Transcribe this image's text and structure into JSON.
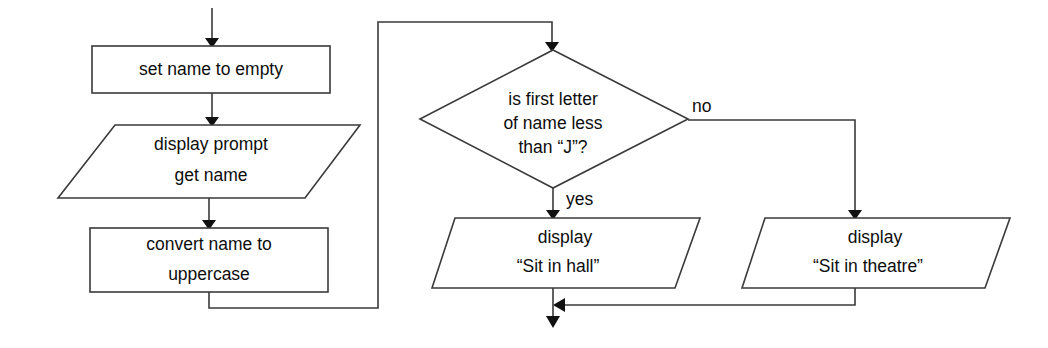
{
  "diagram": {
    "type": "flowchart",
    "nodes": [
      {
        "id": "set-name",
        "shape": "process",
        "lines": [
          "set name to empty"
        ]
      },
      {
        "id": "display-prompt",
        "shape": "input-output",
        "lines": [
          "display prompt",
          "get name"
        ]
      },
      {
        "id": "convert-uppercase",
        "shape": "process",
        "lines": [
          "convert name to",
          "uppercase"
        ]
      },
      {
        "id": "first-letter-decision",
        "shape": "decision",
        "lines": [
          "is first letter",
          "of name less",
          "than “J”?"
        ]
      },
      {
        "id": "display-hall",
        "shape": "input-output",
        "lines": [
          "display",
          "“Sit in hall”"
        ]
      },
      {
        "id": "display-theatre",
        "shape": "input-output",
        "lines": [
          "display",
          "“Sit in theatre”"
        ]
      }
    ],
    "edge_labels": {
      "decision_yes": "yes",
      "decision_no": "no"
    },
    "colors": {
      "stroke": "#3a3a3a",
      "text": "#0d0d0d",
      "background": "#ffffff",
      "arrow": "#111111"
    }
  }
}
